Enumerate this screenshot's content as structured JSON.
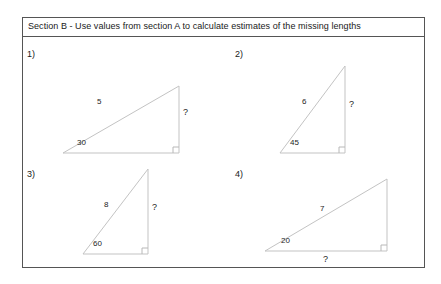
{
  "header": {
    "title": "Section B - Use values from section A to calculate estimates of the missing lengths"
  },
  "problems": [
    {
      "number": "1)",
      "hypotenuse_label": "5",
      "angle_label": "30",
      "vertical_label": "?",
      "base_label": ""
    },
    {
      "number": "2)",
      "hypotenuse_label": "6",
      "angle_label": "45",
      "vertical_label": "?",
      "base_label": ""
    },
    {
      "number": "3)",
      "hypotenuse_label": "8",
      "angle_label": "60",
      "vertical_label": "?",
      "base_label": ""
    },
    {
      "number": "4)",
      "hypotenuse_label": "7",
      "angle_label": "20",
      "vertical_label": "",
      "base_label": "?"
    }
  ],
  "colors": {
    "border": "#555555",
    "triangle_stroke": "#c3c3c3",
    "text": "#1a1a1a",
    "background": "#ffffff"
  }
}
